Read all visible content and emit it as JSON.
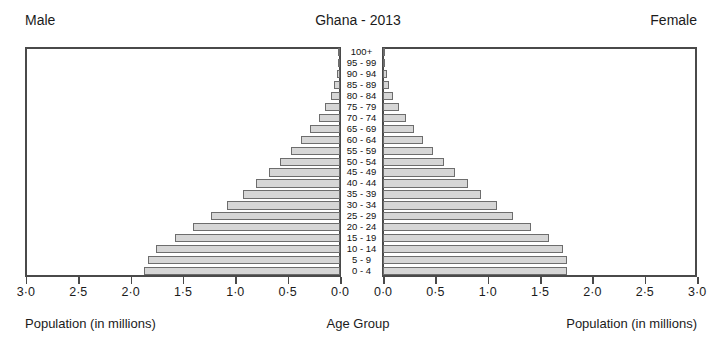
{
  "header": {
    "supertitle": "",
    "male_label": "Male",
    "title": "Ghana - 2013",
    "female_label": "Female"
  },
  "footer": {
    "left_axis_label": "Population (in millions)",
    "center_axis_label": "Age Group",
    "right_axis_label": "Population (in millions)"
  },
  "colors": {
    "bar_fill": "#d6d6d6",
    "bar_stroke": "#6d6d6d",
    "frame": "#4a4a4a",
    "text": "#1b1b1b",
    "background": "#ffffff"
  },
  "axis": {
    "max": 3.0,
    "tick_step": 0.5,
    "left_ticks": [
      "3·0",
      "2·5",
      "2·0",
      "1·5",
      "1·0",
      "0·5",
      "0·0"
    ],
    "right_ticks": [
      "0·0",
      "0·5",
      "1·0",
      "1·5",
      "2·0",
      "2·5",
      "3·0"
    ],
    "decimal_separator": "·"
  },
  "chart_data": {
    "type": "bar",
    "subtype": "population-pyramid",
    "title": "Ghana - 2013",
    "xlabel": "Population (in millions)",
    "ylabel": "Age Group",
    "xlim": [
      0,
      3.0
    ],
    "grid": false,
    "legend": [
      "Male",
      "Female"
    ],
    "legend_position": "top-corners",
    "categories": [
      "100+",
      "95 - 99",
      "90 - 94",
      "85 - 89",
      "80 - 84",
      "75 - 79",
      "70 - 74",
      "65 - 69",
      "60 - 64",
      "55 - 59",
      "50 - 54",
      "45 - 49",
      "40 - 44",
      "35 - 39",
      "30 - 34",
      "25 - 29",
      "20 - 24",
      "15 - 19",
      "10 - 14",
      "5 - 9",
      "0 - 4"
    ],
    "series": [
      {
        "name": "Male",
        "side": "left",
        "units": "millions",
        "values": [
          0.005,
          0.012,
          0.03,
          0.055,
          0.085,
          0.14,
          0.205,
          0.285,
          0.375,
          0.47,
          0.57,
          0.68,
          0.8,
          0.93,
          1.075,
          1.23,
          1.4,
          1.58,
          1.76,
          1.835,
          1.87
        ]
      },
      {
        "name": "Female",
        "side": "right",
        "units": "millions",
        "values": [
          0.006,
          0.014,
          0.034,
          0.062,
          0.095,
          0.15,
          0.215,
          0.295,
          0.385,
          0.48,
          0.58,
          0.69,
          0.81,
          0.94,
          1.085,
          1.24,
          1.41,
          1.585,
          1.72,
          1.755,
          1.76
        ]
      }
    ]
  }
}
